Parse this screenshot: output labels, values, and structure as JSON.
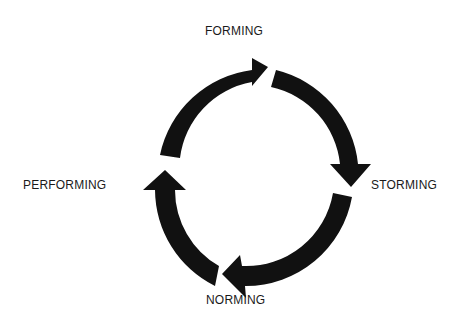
{
  "diagram": {
    "type": "cycle",
    "direction": "clockwise",
    "arrow_color": "#111111",
    "background": "#ffffff",
    "stages": [
      {
        "label": "FORMING",
        "position": "top"
      },
      {
        "label": "STORMING",
        "position": "right"
      },
      {
        "label": "NORMING",
        "position": "bottom"
      },
      {
        "label": "PERFORMING",
        "position": "left"
      }
    ],
    "arrows": [
      {
        "from": "PERFORMING",
        "to": "FORMING",
        "icon": "curved-arrow-icon"
      },
      {
        "from": "FORMING",
        "to": "STORMING",
        "icon": "curved-arrow-icon"
      },
      {
        "from": "STORMING",
        "to": "NORMING",
        "icon": "curved-arrow-icon"
      },
      {
        "from": "NORMING",
        "to": "PERFORMING",
        "icon": "curved-arrow-icon"
      }
    ]
  }
}
